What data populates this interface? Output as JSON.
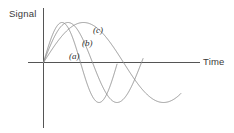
{
  "figure": {
    "background_color": "#ffffff",
    "axis_color": "#555555",
    "curve_color": "#8a8a8a"
  },
  "labels": {
    "y_axis": "Signal",
    "x_axis": "Time",
    "curve_a": "(a)",
    "curve_b": "(b)",
    "curve_c": "(c)"
  },
  "chart_data": {
    "type": "line",
    "title": "",
    "xlabel": "Time",
    "ylabel": "Signal",
    "grid": false,
    "legend": "inline-annotations",
    "axis_origin_px": {
      "x": 43,
      "y": 62
    },
    "x_axis_range_px": [
      28,
      200
    ],
    "y_axis_range_px": [
      8,
      128
    ],
    "series": [
      {
        "name": "(a)",
        "label": "(a)",
        "period_px": 74,
        "amplitude_px": 40,
        "peak_px": {
          "x": 58,
          "y": 22
        },
        "trough_px": {
          "x": 77,
          "y": 106
        },
        "zero_crossings_px": [
          43,
          77,
          117
        ],
        "end_px": 117,
        "color": "#8a8a8a"
      },
      {
        "name": "(b)",
        "label": "(b)",
        "period_px": 98,
        "amplitude_px": 40,
        "peak_px": {
          "x": 66,
          "y": 21
        },
        "trough_px": {
          "x": 95,
          "y": 107
        },
        "zero_crossings_px": [
          43,
          95,
          143
        ],
        "end_px": 143,
        "color": "#8a8a8a"
      },
      {
        "name": "(c)",
        "label": "(c)",
        "period_px": 160,
        "amplitude_px": 40,
        "peak_px": {
          "x": 80,
          "y": 22
        },
        "trough_px": {
          "x": 125,
          "y": 108
        },
        "zero_crossings_px": [
          43,
          125,
          181
        ],
        "end_px": 181,
        "color": "#8a8a8a"
      }
    ]
  }
}
